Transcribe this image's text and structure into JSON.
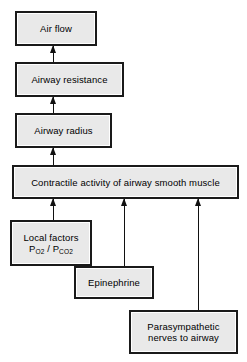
{
  "diagram": {
    "type": "flowchart",
    "colors": {
      "box_fill": "#e9e9e9",
      "box_border": "#1a1a1a",
      "box_inner_highlight": "#ffffff",
      "arrow": "#111111",
      "text": "#000000",
      "background": "#ffffff"
    },
    "nodes": [
      {
        "id": "air-flow",
        "label": "Air flow"
      },
      {
        "id": "airway-resistance",
        "label": "Airway resistance"
      },
      {
        "id": "airway-radius",
        "label": "Airway radius"
      },
      {
        "id": "contractile-activity",
        "label": "Contractile activity of airway smooth muscle"
      },
      {
        "id": "local-factors",
        "label_line1": "Local factors",
        "label_line2_prefix": "P",
        "label_line2_sub1": "O",
        "label_line2_sub1_num": "2",
        "label_line2_sep": " / P",
        "label_line2_sub2": "CO",
        "label_line2_sub2_num": "2",
        "label_plain": "Local factors PO2 / PCO2"
      },
      {
        "id": "epinephrine",
        "label": "Epinephrine"
      },
      {
        "id": "parasympathetic",
        "label": "Parasympathetic\nnerves to airway"
      }
    ],
    "edges": [
      {
        "from": "airway-resistance",
        "to": "air-flow",
        "direction": "up"
      },
      {
        "from": "airway-radius",
        "to": "airway-resistance",
        "direction": "up"
      },
      {
        "from": "contractile-activity",
        "to": "airway-radius",
        "direction": "up"
      },
      {
        "from": "local-factors",
        "to": "contractile-activity",
        "direction": "up"
      },
      {
        "from": "epinephrine",
        "to": "contractile-activity",
        "direction": "up"
      },
      {
        "from": "parasympathetic",
        "to": "contractile-activity",
        "direction": "up"
      }
    ]
  }
}
